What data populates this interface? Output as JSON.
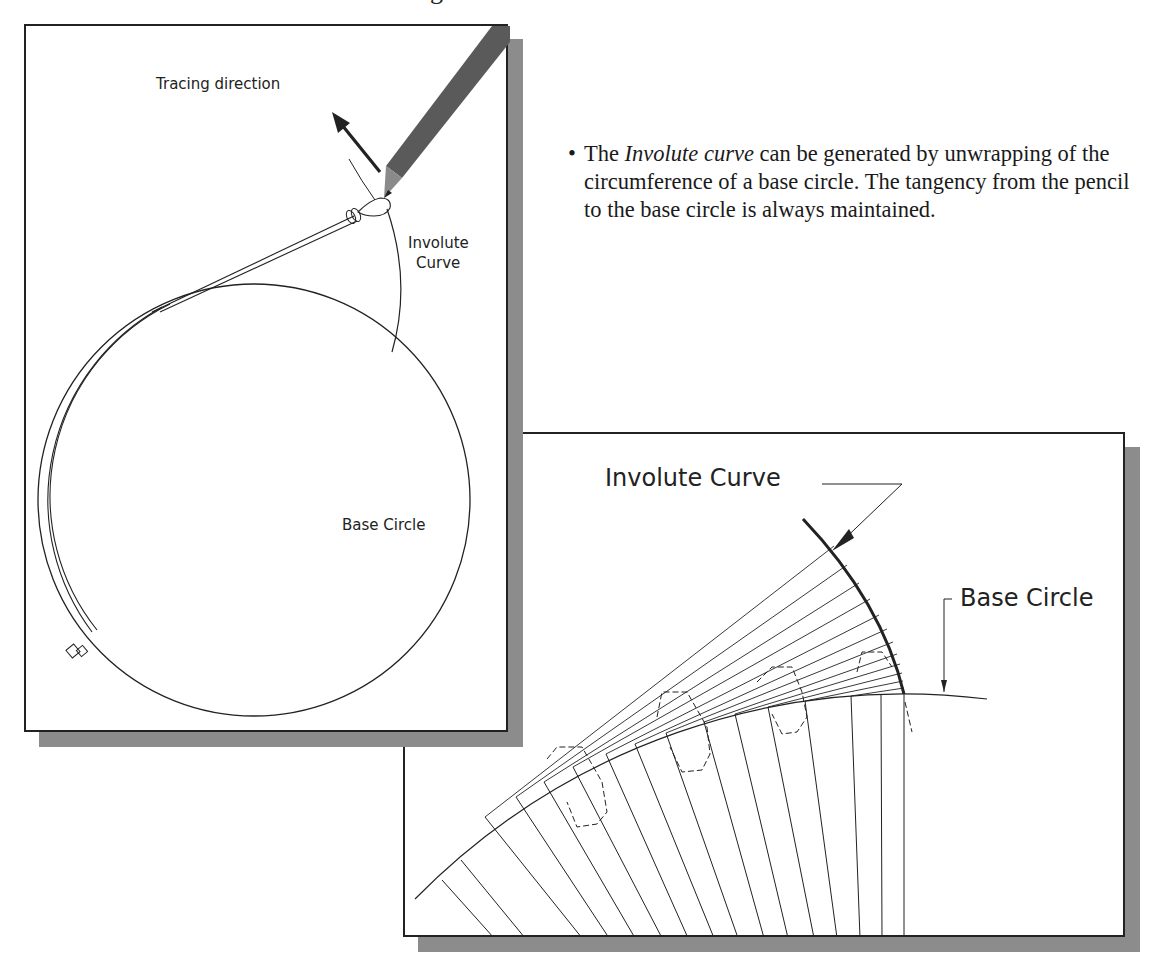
{
  "header": {
    "clipped_fragment": "g"
  },
  "left_figure": {
    "labels": {
      "tracing_direction": "Tracing direction",
      "involute_line1": "Involute",
      "involute_line2": "Curve",
      "base_circle": "Base Circle"
    },
    "icons": [
      "pencil-icon",
      "hand-icon",
      "arrow-icon",
      "string-loop-icon"
    ]
  },
  "description": {
    "bullet": "•",
    "prefix": "The ",
    "emphasis": "Involute curve",
    "suffix": " can be generated by unwrapping of the circumference of a base circle. The tangency from the pencil to the base circle is always maintained."
  },
  "right_figure": {
    "labels": {
      "involute_curve": "Involute Curve",
      "base_circle": "Base Circle"
    }
  },
  "colors": {
    "line": "#222222",
    "shadow": "#8c8c8c",
    "pencil": "#555555",
    "background": "#ffffff"
  }
}
